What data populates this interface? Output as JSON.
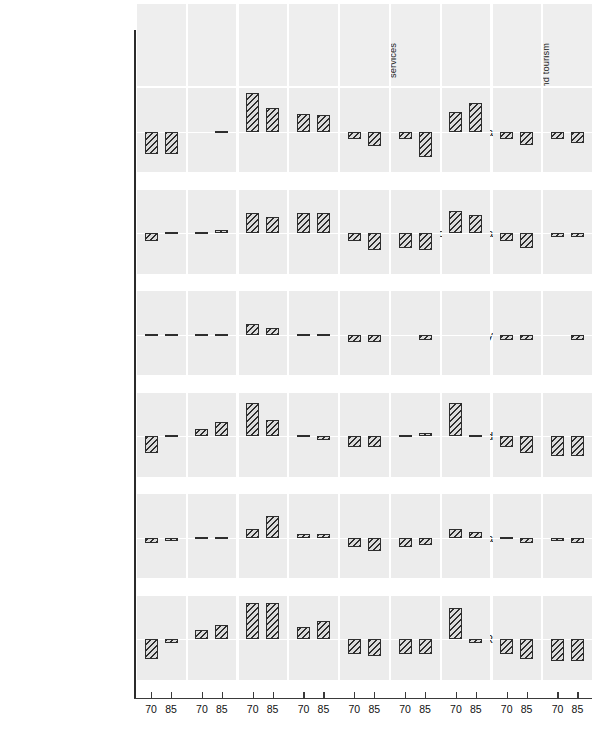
{
  "chart_data": {
    "type": "bar",
    "title": "",
    "subtitle": "",
    "xlabel": "",
    "ylabel": "",
    "ylim": [
      78,
      124
    ],
    "yticks": [
      120,
      110,
      100,
      90,
      80
    ],
    "baseline": 100,
    "grid": false,
    "legend_position": "none",
    "x": [
      "70",
      "85"
    ],
    "x_label_70": "70",
    "x_label_85": "85",
    "categories": [
      "Agriculture",
      "Industry",
      "Construction",
      "Transport",
      "Commerce",
      "Housing and community services",
      "Science and research",
      "Education and culture",
      "Health, social sec., sports and tourism"
    ],
    "category_lines": [
      [
        "Agriculture"
      ],
      [
        "Industry"
      ],
      [
        "Construction"
      ],
      [
        "Transport"
      ],
      [
        "Commerce"
      ],
      [
        "Housing and",
        "community",
        "services"
      ],
      [
        "Science and",
        "research"
      ],
      [
        "Education",
        "and culture"
      ],
      [
        "Health, social",
        "sec., sports",
        "and tourism"
      ]
    ],
    "rows": [
      "Bulgaria",
      "Czechoslovakia",
      "Hungary",
      "Poland",
      "Romania",
      "USSR"
    ],
    "series": [
      {
        "name": "Bulgaria",
        "values_70": [
          88,
          null,
          121,
          110,
          96,
          96,
          111,
          96,
          96
        ],
        "values_85": [
          88,
          100,
          113,
          109,
          92,
          86,
          116,
          93,
          94
        ]
      },
      {
        "name": "Czechoslovakia",
        "values_70": [
          96,
          100,
          111,
          111,
          96,
          92,
          112,
          96,
          98
        ],
        "values_85": [
          101,
          102,
          109,
          111,
          91,
          91,
          110,
          92,
          98
        ]
      },
      {
        "name": "Hungary",
        "values_70": [
          100,
          99,
          106,
          99,
          96,
          null,
          null,
          97,
          null
        ],
        "values_85": [
          99,
          100,
          104,
          100,
          96,
          97,
          null,
          97,
          97
        ]
      },
      {
        "name": "Poland",
        "values_70": [
          91,
          104,
          118,
          99,
          94,
          101,
          118,
          94,
          89
        ],
        "values_85": [
          100,
          108,
          109,
          98,
          94,
          102,
          100,
          91,
          89
        ]
      },
      {
        "name": "Romania",
        "values_70": [
          97,
          100,
          105,
          102,
          95,
          95,
          105,
          100,
          98
        ],
        "values_85": [
          98,
          100,
          112,
          102,
          93,
          96,
          103,
          97,
          97
        ]
      },
      {
        "name": "USSR",
        "values_70": [
          89,
          105,
          120,
          107,
          92,
          92,
          117,
          92,
          88
        ],
        "values_85": [
          98,
          108,
          120,
          110,
          91,
          92,
          98,
          89,
          88
        ]
      }
    ]
  }
}
